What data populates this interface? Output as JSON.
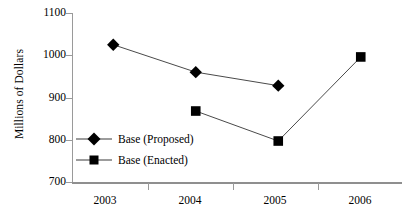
{
  "chart_data": {
    "type": "line",
    "title": "",
    "xlabel": "",
    "ylabel": "Millions of Dollars",
    "categories": [
      "2003",
      "2004",
      "2005",
      "2006"
    ],
    "ylim": [
      700,
      1100
    ],
    "ytick_labels": [
      "700",
      "800",
      "900",
      "1000",
      "1100"
    ],
    "ytick_values": [
      700,
      800,
      900,
      1000,
      1100
    ],
    "grid": false,
    "legend_position": "inside-lower-left",
    "series": [
      {
        "name": "Base (Proposed)",
        "marker": "diamond",
        "color": "#000000",
        "x": [
          "2003",
          "2004",
          "2005"
        ],
        "values": [
          1025,
          960,
          928
        ]
      },
      {
        "name": "Base (Enacted)",
        "marker": "square",
        "color": "#000000",
        "x": [
          "2004",
          "2005",
          "2006"
        ],
        "values": [
          868,
          797,
          996
        ]
      }
    ]
  },
  "axis": {
    "y_title": "Millions of Dollars",
    "y_ticks": [
      {
        "label": "1100"
      },
      {
        "label": "1000"
      },
      {
        "label": "900"
      },
      {
        "label": "800"
      },
      {
        "label": "700"
      }
    ],
    "x_ticks": [
      {
        "label": "2003"
      },
      {
        "label": "2004"
      },
      {
        "label": "2005"
      },
      {
        "label": "2006"
      }
    ]
  },
  "legend": {
    "items": [
      {
        "label": "Base (Proposed)",
        "marker": "diamond"
      },
      {
        "label": "Base (Enacted)",
        "marker": "square"
      }
    ]
  }
}
